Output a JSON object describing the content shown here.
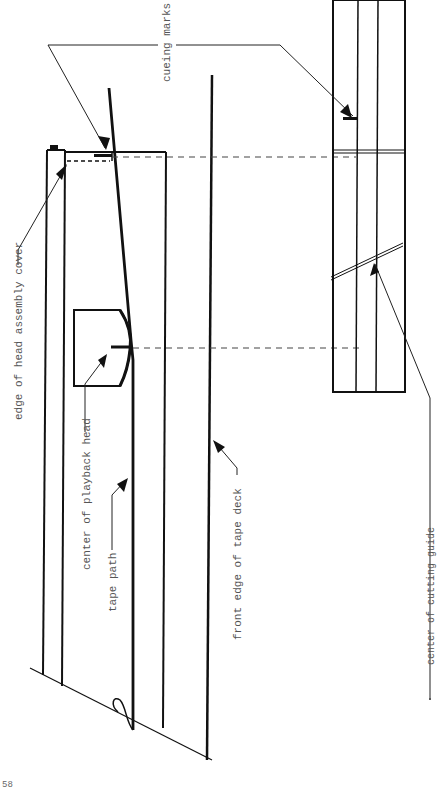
{
  "diagram": {
    "type": "technical-illustration",
    "orientation": "rotated-90-ccw",
    "labels": {
      "cueing_marks": "cueing marks",
      "edge_of_head_assembly_cover": "edge of head assembly cover",
      "center_of_playback_head": "center of playback head",
      "tape_path": "tape path",
      "front_edge_of_tape_deck": "front edge of tape deck",
      "center_of_cutting_guide": "center of cutting guide"
    },
    "page_number": "58",
    "colors": {
      "line": "#111111",
      "label": "#555555",
      "background": "#ffffff"
    }
  }
}
